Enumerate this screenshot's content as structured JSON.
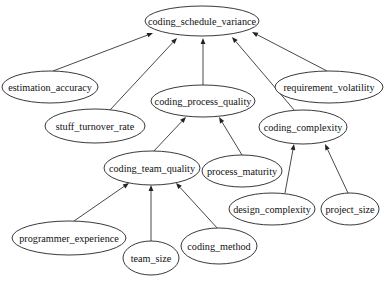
{
  "diagram": {
    "type": "directed-graph",
    "nodes": [
      {
        "id": "coding_schedule_variance",
        "label": "coding_schedule_variance",
        "cx": 202,
        "cy": 21,
        "rx": 57,
        "ry": 15
      },
      {
        "id": "estimation_accuracy",
        "label": "estimation_accuracy",
        "cx": 50,
        "cy": 87,
        "rx": 48,
        "ry": 16
      },
      {
        "id": "requirement_volatility",
        "label": "requirement_volatility",
        "cx": 329,
        "cy": 87,
        "rx": 54,
        "ry": 16
      },
      {
        "id": "coding_process_quality",
        "label": "coding_process_quality",
        "cx": 203,
        "cy": 101,
        "rx": 52,
        "ry": 16
      },
      {
        "id": "stuff_turnover_rate",
        "label": "stuff_turnover_rate",
        "cx": 95,
        "cy": 126,
        "rx": 50,
        "ry": 17
      },
      {
        "id": "coding_complexity",
        "label": "coding_complexity",
        "cx": 303,
        "cy": 127,
        "rx": 44,
        "ry": 17
      },
      {
        "id": "coding_team_quality",
        "label": "coding_team_quality",
        "cx": 152,
        "cy": 168,
        "rx": 48,
        "ry": 17
      },
      {
        "id": "process_maturity",
        "label": "process_maturity",
        "cx": 242,
        "cy": 171,
        "rx": 40,
        "ry": 16
      },
      {
        "id": "design_complexity",
        "label": "design_complexity",
        "cx": 272,
        "cy": 209,
        "rx": 43,
        "ry": 16
      },
      {
        "id": "project_size",
        "label": "project_size",
        "cx": 350,
        "cy": 209,
        "rx": 29,
        "ry": 16
      },
      {
        "id": "programmer_experience",
        "label": "programmer_experience",
        "cx": 69,
        "cy": 238,
        "rx": 57,
        "ry": 17
      },
      {
        "id": "team_size",
        "label": "team_size",
        "cx": 151,
        "cy": 258,
        "rx": 28,
        "ry": 17
      },
      {
        "id": "coding_method",
        "label": "coding_method",
        "cx": 219,
        "cy": 246,
        "rx": 38,
        "ry": 18
      }
    ],
    "edges": [
      {
        "from": "estimation_accuracy",
        "to": "coding_schedule_variance",
        "x1": 53,
        "y1": 71,
        "x2": 153,
        "y2": 33
      },
      {
        "from": "stuff_turnover_rate",
        "to": "coding_schedule_variance",
        "x1": 110,
        "y1": 110,
        "x2": 177,
        "y2": 38
      },
      {
        "from": "coding_process_quality",
        "to": "coding_schedule_variance",
        "x1": 203,
        "y1": 85,
        "x2": 203,
        "y2": 38
      },
      {
        "from": "coding_complexity",
        "to": "coding_schedule_variance",
        "x1": 295,
        "y1": 111,
        "x2": 232,
        "y2": 37
      },
      {
        "from": "requirement_volatility",
        "to": "coding_schedule_variance",
        "x1": 327,
        "y1": 71,
        "x2": 252,
        "y2": 32
      },
      {
        "from": "coding_team_quality",
        "to": "coding_process_quality",
        "x1": 153,
        "y1": 152,
        "x2": 186,
        "y2": 117
      },
      {
        "from": "process_maturity",
        "to": "coding_process_quality",
        "x1": 242,
        "y1": 155,
        "x2": 219,
        "y2": 117
      },
      {
        "from": "design_complexity",
        "to": "coding_complexity",
        "x1": 285,
        "y1": 193,
        "x2": 294,
        "y2": 144
      },
      {
        "from": "project_size",
        "to": "coding_complexity",
        "x1": 348,
        "y1": 193,
        "x2": 325,
        "y2": 144
      },
      {
        "from": "programmer_experience",
        "to": "coding_team_quality",
        "x1": 74,
        "y1": 221,
        "x2": 129,
        "y2": 183
      },
      {
        "from": "team_size",
        "to": "coding_team_quality",
        "x1": 151,
        "y1": 241,
        "x2": 151,
        "y2": 185
      },
      {
        "from": "coding_method",
        "to": "coding_team_quality",
        "x1": 219,
        "y1": 230,
        "x2": 176,
        "y2": 183
      }
    ]
  }
}
